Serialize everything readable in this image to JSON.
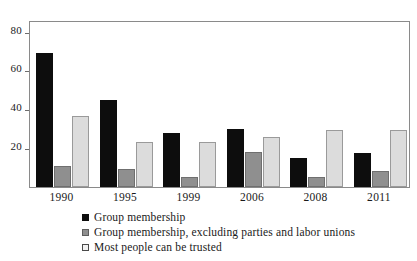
{
  "chart_data": {
    "type": "bar",
    "title": "",
    "subtitle": "",
    "xlabel": "",
    "ylabel": "",
    "categories": [
      "1990",
      "1995",
      "1999",
      "2006",
      "2008",
      "2011"
    ],
    "series": [
      {
        "name": "Group membership",
        "color": "#0d0d0d",
        "values": [
          69,
          45,
          28,
          30,
          15,
          17.5
        ]
      },
      {
        "name": "Group membership, excluding parties and labor unions",
        "color": "#8f8f8f",
        "values": [
          11,
          9.5,
          5,
          18,
          5,
          8
        ]
      },
      {
        "name": "Most people can be trusted",
        "color": "#dcdcdc",
        "values": [
          36.5,
          23,
          23,
          25.5,
          29.5,
          29.5
        ]
      }
    ],
    "ylim": [
      0,
      86
    ],
    "yticks": [
      20,
      40,
      60,
      80
    ],
    "ytick_labels": [
      "20",
      "40",
      "60",
      "80"
    ],
    "grid": false,
    "legend_position": "bottom-left"
  },
  "legend": {
    "items": [
      {
        "label": "Group membership",
        "swatch": "black-square-icon"
      },
      {
        "label": "Group membership, excluding parties and labor unions",
        "swatch": "gray-square-icon"
      },
      {
        "label": "Most people can be trusted",
        "swatch": "light-square-icon"
      }
    ]
  }
}
